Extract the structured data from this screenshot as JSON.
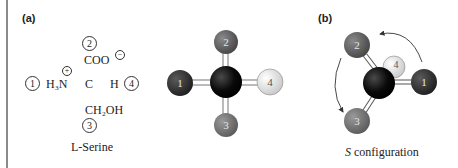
{
  "panels": {
    "a": {
      "label": "(a)",
      "fischer": {
        "priority_1": "1",
        "priority_2": "2",
        "priority_3": "3",
        "priority_4": "4",
        "group_left": "H₃N",
        "group_top": "COO",
        "group_bottom": "CH₂OH",
        "group_right": "H",
        "center": "C",
        "charge_plus": "+",
        "charge_minus": "−"
      },
      "caption": "L-Serine",
      "model": {
        "balls": [
          {
            "label": "1",
            "color": "#2b2b2b"
          },
          {
            "label": "2",
            "color": "#5a5a5a"
          },
          {
            "label": "3",
            "color": "#6e6e6e"
          },
          {
            "label": "4",
            "color": "#e3e3e3"
          }
        ],
        "center_color": "#0a0a0a"
      }
    },
    "b": {
      "label": "(b)",
      "caption_italic": "S",
      "caption_rest": " configuration",
      "balls": [
        {
          "label": "1",
          "color": "#2b2b2b"
        },
        {
          "label": "2",
          "color": "#5a5a5a"
        },
        {
          "label": "3",
          "color": "#6e6e6e"
        },
        {
          "label": "4",
          "color": "#e3e3e3"
        }
      ]
    }
  }
}
